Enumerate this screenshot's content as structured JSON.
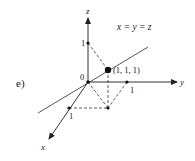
{
  "diagram": {
    "part_label": "e)",
    "equation": "x = y = z",
    "axes": {
      "x": {
        "label": "x",
        "tick_label": "1"
      },
      "y": {
        "label": "y",
        "tick_label": "1"
      },
      "z": {
        "label": "z",
        "tick_label": "1"
      }
    },
    "origin_label": "0",
    "point": {
      "label": "(1, 1, 1)"
    },
    "colors": {
      "stroke": "#333333",
      "text": "#222222"
    }
  }
}
